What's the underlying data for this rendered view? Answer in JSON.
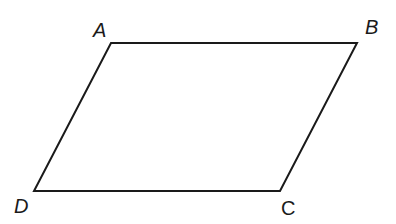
{
  "diagram": {
    "type": "parallelogram",
    "stroke_color": "#1a1a1a",
    "stroke_width": 2,
    "vertices": [
      {
        "name": "A",
        "x": 111,
        "y": 43
      },
      {
        "name": "B",
        "x": 357,
        "y": 43
      },
      {
        "name": "C",
        "x": 280,
        "y": 191
      },
      {
        "name": "D",
        "x": 34,
        "y": 191
      }
    ],
    "labels": {
      "A": {
        "text": "A",
        "x": 93,
        "y": 37
      },
      "B": {
        "text": "B",
        "x": 365,
        "y": 34
      },
      "C": {
        "text": "C",
        "x": 281,
        "y": 215
      },
      "D": {
        "text": "D",
        "x": 14,
        "y": 213
      }
    }
  }
}
